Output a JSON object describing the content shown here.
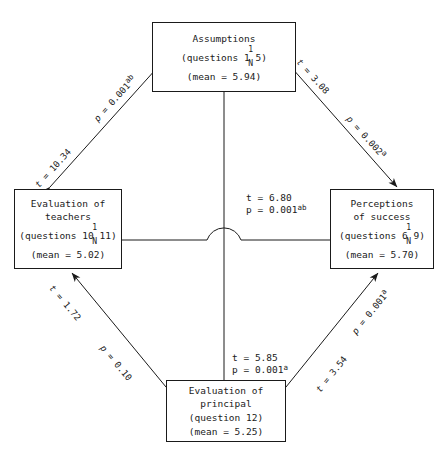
{
  "diagram": {
    "type": "path-model",
    "nodes": [
      {
        "id": "assumptions",
        "position": "top",
        "title": "Assumptions",
        "questions_prefix": "(questions 1",
        "questions_suffix": "5)",
        "questions_sup": "1",
        "questions_sub": "N",
        "mean_label": "(mean = 5.94)"
      },
      {
        "id": "evaluation-of-teachers",
        "position": "left",
        "title": "Evaluation of\nteachers",
        "questions_prefix": "(questions 10",
        "questions_suffix": "11)",
        "questions_sup": "1",
        "questions_sub": "N",
        "mean_label": "(mean = 5.02)"
      },
      {
        "id": "perceptions-of-success",
        "position": "right",
        "title": "Perceptions\nof success",
        "questions_prefix": "(questions 6",
        "questions_suffix": "9)",
        "questions_sup": "1",
        "questions_sub": "N",
        "mean_label": "(mean = 5.70)"
      },
      {
        "id": "evaluation-of-principal",
        "position": "bottom",
        "title": "Evaluation of\nprincipal",
        "questions_prefix": "(question 12)",
        "questions_suffix": "",
        "questions_sup": "",
        "questions_sub": "",
        "mean_label": "(mean = 5.25)"
      }
    ],
    "edges": [
      {
        "id": "teachers-assumptions",
        "from": "evaluation-of-teachers",
        "to": "assumptions",
        "t_label": "t = 10.34",
        "p_label": "p = 0.001",
        "p_sup": "ab",
        "arrowheads": "both"
      },
      {
        "id": "assumptions-perceptions",
        "from": "assumptions",
        "to": "perceptions-of-success",
        "t_label": "t = 3.08",
        "p_label": "p = 0.002",
        "p_sup": "a",
        "arrowheads": "both"
      },
      {
        "id": "principal-teachers",
        "from": "evaluation-of-principal",
        "to": "evaluation-of-teachers",
        "t_label": "t = 1.72",
        "p_label": "p = 0.10",
        "p_sup": "",
        "arrowheads": "both"
      },
      {
        "id": "principal-perceptions",
        "from": "evaluation-of-principal",
        "to": "perceptions-of-success",
        "t_label": "t = 3.54",
        "p_label": "p = 0.001",
        "p_sup": "a",
        "arrowheads": "both"
      },
      {
        "id": "teachers-perceptions-horizontal",
        "from": "evaluation-of-teachers",
        "to": "perceptions-of-success",
        "t_label": "t = 6.80",
        "p_label": "p = 0.001",
        "p_sup": "ab",
        "arrowheads": "none"
      },
      {
        "id": "assumptions-principal-vertical",
        "from": "assumptions",
        "to": "evaluation-of-principal",
        "t_label": "t = 5.85",
        "p_label": "p = 0.001",
        "p_sup": "a",
        "arrowheads": "none"
      }
    ],
    "colors": {
      "line": "#1a1a1a",
      "text": "#1a1a1a",
      "background": "#ffffff"
    }
  }
}
